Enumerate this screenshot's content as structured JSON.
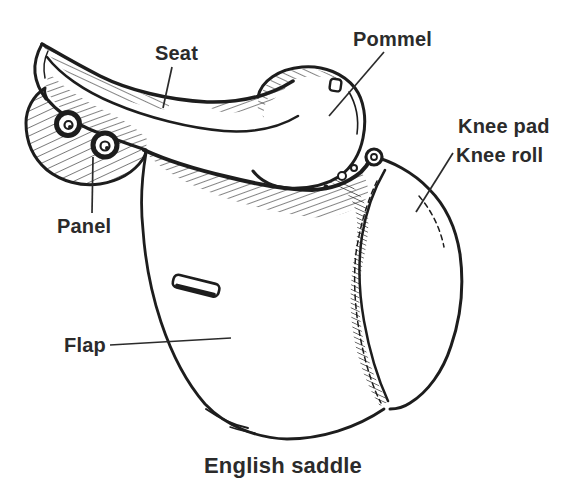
{
  "figure": {
    "caption": "English saddle"
  },
  "labels": {
    "seat": "Seat",
    "pommel": "Pommel",
    "knee_pad": "Knee pad",
    "knee_roll": "Knee roll",
    "panel": "Panel",
    "flap": "Flap"
  },
  "colors": {
    "background": "#ffffff",
    "ink": "#1d1d1d",
    "label_text": "#2b2b2b"
  }
}
